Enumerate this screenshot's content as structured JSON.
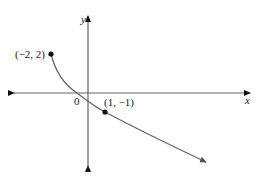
{
  "figure": {
    "type": "function-graph",
    "axes": {
      "x_label": "x",
      "y_label": "y",
      "origin_label": "0",
      "color": "#555555"
    },
    "curve": {
      "color": "#666666",
      "description": "Decreasing curve starting at closed point (-2, 2), passing through (1, -1), continuing down-right with an arrow"
    },
    "points": [
      {
        "label": "(−2, 2)",
        "x": -2,
        "y": 2,
        "marker": "closed-dot"
      },
      {
        "label": "(1, −1)",
        "x": 1,
        "y": -1,
        "marker": "closed-dot"
      }
    ],
    "colors": {
      "axis": "#555555",
      "curve": "#666666",
      "point": "#111111",
      "text": "#222222"
    }
  }
}
